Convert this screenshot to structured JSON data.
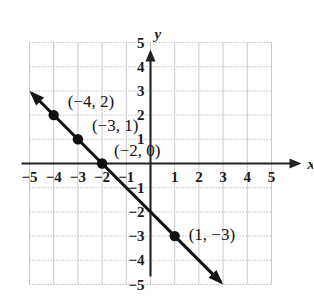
{
  "figure": {
    "kind": "coordinate-plane-line-graph",
    "axis_labels": {
      "x": "x",
      "y": "y"
    },
    "x_axis": {
      "min": -5,
      "max": 5,
      "ticks": [
        -5,
        -4,
        -3,
        -2,
        -1,
        1,
        2,
        3,
        4,
        5
      ],
      "tick_labels": [
        "−5",
        "−4",
        "−3",
        "−2",
        "−1",
        "1",
        "2",
        "3",
        "4",
        "5"
      ]
    },
    "y_axis": {
      "min": -5,
      "max": 5,
      "ticks": [
        5,
        4,
        3,
        2,
        1,
        -1,
        -2,
        -3,
        -4,
        -5
      ],
      "tick_labels": [
        "5",
        "4",
        "3",
        "2",
        "1",
        "−1",
        "−2",
        "−3",
        "−4",
        "−5"
      ]
    },
    "grid": "on",
    "line": {
      "slope": -1,
      "y_intercept": -2,
      "equation": "y = -x - 2",
      "from": {
        "x": -5,
        "y": 3
      },
      "to": {
        "x": 3,
        "y": -5
      },
      "arrows": "both"
    },
    "points": [
      {
        "x": -4,
        "y": 2,
        "label": "(−4, 2)",
        "label_dx": 14,
        "label_dy": -8
      },
      {
        "x": -3,
        "y": 1,
        "label": "(−3, 1)",
        "label_dx": 14,
        "label_dy": -8
      },
      {
        "x": -2,
        "y": 0,
        "label": "(−2, 0)",
        "label_dx": 12,
        "label_dy": -8
      },
      {
        "x": 1,
        "y": -3,
        "label": "(1, −3)",
        "label_dx": 14,
        "label_dy": 4
      }
    ],
    "colors": {
      "background": "#ffffff",
      "axis": "#222222",
      "grid_vertical": "#c9c9c9",
      "grid_horizontal": "#bdbdbd",
      "plot_line": "#141414",
      "point_fill": "#101010",
      "text": "#111111"
    }
  },
  "chart_data": {
    "type": "line",
    "title": "",
    "xlabel": "x",
    "ylabel": "y",
    "xlim": [
      -5,
      5
    ],
    "ylim": [
      -5,
      5
    ],
    "grid": true,
    "legend": "none",
    "series": [
      {
        "name": "y = -x - 2",
        "x": [
          -5,
          -4,
          -3,
          -2,
          -1,
          0,
          1,
          2,
          3
        ],
        "y": [
          3,
          2,
          1,
          0,
          -1,
          -2,
          -3,
          -4,
          -5
        ],
        "marked_points": [
          {
            "x": -4,
            "y": 2
          },
          {
            "x": -3,
            "y": 1
          },
          {
            "x": -2,
            "y": 0
          },
          {
            "x": 1,
            "y": -3
          }
        ]
      }
    ],
    "annotations": [
      "(−4, 2)",
      "(−3, 1)",
      "(−2, 0)",
      "(1, −3)"
    ]
  }
}
